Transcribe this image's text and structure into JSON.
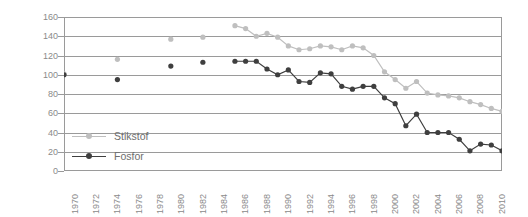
{
  "chart_data": {
    "type": "line",
    "title": "",
    "subtitle": "",
    "xlabel": "",
    "ylabel": "Index (1970 = 100)",
    "ylim": [
      0,
      160
    ],
    "xlim": [
      1970,
      2011
    ],
    "grid": true,
    "legend_position": "inside-left",
    "y_ticks": [
      0,
      20,
      40,
      60,
      80,
      100,
      120,
      140,
      160
    ],
    "y_tick_labels": [
      "0",
      "20",
      "40",
      "60",
      "80",
      "100",
      "120",
      "140",
      "160"
    ],
    "x_ticks": [
      1970,
      1972,
      1974,
      1976,
      1978,
      1980,
      1982,
      1984,
      1986,
      1988,
      1990,
      1992,
      1994,
      1996,
      1998,
      2000,
      2002,
      2004,
      2006,
      2008,
      2010
    ],
    "x_tick_labels": [
      "1970",
      "1972",
      "1974",
      "1976",
      "1978",
      "1980",
      "1982",
      "1984",
      "1986",
      "1988",
      "1990",
      "1992",
      "1994",
      "1996",
      "1998",
      "2000",
      "2002",
      "2004",
      "2006",
      "2008",
      "2010"
    ],
    "colors": {
      "stikstof": "#bfbfbf",
      "fosfor": "#3f3f3f",
      "axis": "#9a9a9a",
      "text": "#8a8a8a",
      "background": "#ffffff"
    },
    "series": [
      {
        "name": "Stikstof",
        "color": "#bfbfbf",
        "marker": "circle",
        "points": [
          {
            "x": 1970,
            "y": 101
          },
          {
            "x": 1975,
            "y": 116
          },
          {
            "x": 1980,
            "y": 137
          },
          {
            "x": 1983,
            "y": 139
          },
          {
            "x": 1986,
            "y": 151
          },
          {
            "x": 1987,
            "y": 148
          },
          {
            "x": 1988,
            "y": 140
          },
          {
            "x": 1989,
            "y": 143
          },
          {
            "x": 1990,
            "y": 139
          },
          {
            "x": 1991,
            "y": 130
          },
          {
            "x": 1992,
            "y": 126
          },
          {
            "x": 1993,
            "y": 127
          },
          {
            "x": 1994,
            "y": 130
          },
          {
            "x": 1995,
            "y": 129
          },
          {
            "x": 1996,
            "y": 126
          },
          {
            "x": 1997,
            "y": 130
          },
          {
            "x": 1998,
            "y": 128
          },
          {
            "x": 1999,
            "y": 120
          },
          {
            "x": 2000,
            "y": 103
          },
          {
            "x": 2001,
            "y": 95
          },
          {
            "x": 2002,
            "y": 86
          },
          {
            "x": 2003,
            "y": 93
          },
          {
            "x": 2004,
            "y": 81
          },
          {
            "x": 2005,
            "y": 79
          },
          {
            "x": 2006,
            "y": 78
          },
          {
            "x": 2007,
            "y": 76
          },
          {
            "x": 2008,
            "y": 72
          },
          {
            "x": 2009,
            "y": 69
          },
          {
            "x": 2010,
            "y": 65
          },
          {
            "x": 2011,
            "y": 62
          }
        ]
      },
      {
        "name": "Fosfor",
        "color": "#3f3f3f",
        "marker": "circle",
        "points": [
          {
            "x": 1970,
            "y": 100
          },
          {
            "x": 1975,
            "y": 95
          },
          {
            "x": 1980,
            "y": 109
          },
          {
            "x": 1983,
            "y": 113
          },
          {
            "x": 1986,
            "y": 114
          },
          {
            "x": 1987,
            "y": 114
          },
          {
            "x": 1988,
            "y": 114
          },
          {
            "x": 1989,
            "y": 106
          },
          {
            "x": 1990,
            "y": 100
          },
          {
            "x": 1991,
            "y": 105
          },
          {
            "x": 1992,
            "y": 93
          },
          {
            "x": 1993,
            "y": 92
          },
          {
            "x": 1994,
            "y": 102
          },
          {
            "x": 1995,
            "y": 101
          },
          {
            "x": 1996,
            "y": 88
          },
          {
            "x": 1997,
            "y": 85
          },
          {
            "x": 1998,
            "y": 88
          },
          {
            "x": 1999,
            "y": 88
          },
          {
            "x": 2000,
            "y": 76
          },
          {
            "x": 2001,
            "y": 70
          },
          {
            "x": 2002,
            "y": 47
          },
          {
            "x": 2003,
            "y": 59
          },
          {
            "x": 2004,
            "y": 40
          },
          {
            "x": 2005,
            "y": 40
          },
          {
            "x": 2006,
            "y": 40
          },
          {
            "x": 2007,
            "y": 33
          },
          {
            "x": 2008,
            "y": 21
          },
          {
            "x": 2009,
            "y": 28
          },
          {
            "x": 2010,
            "y": 27
          },
          {
            "x": 2011,
            "y": 21
          }
        ]
      }
    ]
  },
  "legend": {
    "items": [
      {
        "label": "Stikstof",
        "color": "#bfbfbf"
      },
      {
        "label": "Fosfor",
        "color": "#3f3f3f"
      }
    ]
  }
}
